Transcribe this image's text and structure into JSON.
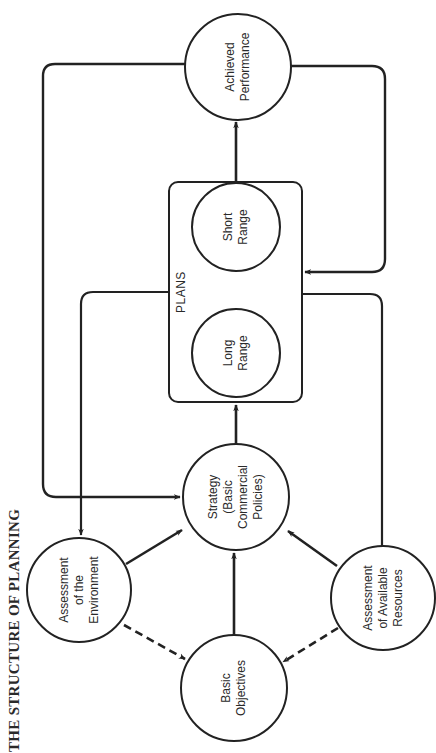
{
  "title": "THE STRUCTURE OF PLANNING",
  "colors": {
    "ink": "#222222",
    "background": "#ffffff"
  },
  "plans_group": {
    "label": "PLANS"
  },
  "nodes": {
    "achieved_performance": {
      "lines": [
        "Achieved",
        "Performance"
      ]
    },
    "short_range": {
      "lines": [
        "Short",
        "Range"
      ]
    },
    "long_range": {
      "lines": [
        "Long",
        "Range"
      ]
    },
    "strategy": {
      "lines": [
        "Strategy",
        "(Basic",
        "Commercial",
        "Policies)"
      ]
    },
    "assessment_environment": {
      "lines": [
        "Assessment",
        "of the",
        "Environment"
      ]
    },
    "basic_objectives": {
      "lines": [
        "Basic",
        "Objectives"
      ]
    },
    "assessment_resources": {
      "lines": [
        "Assessment",
        "of Available",
        "Resources"
      ]
    }
  },
  "edges": [
    {
      "from": "Strategy (Basic Commercial Policies)",
      "to": "PLANS",
      "style": "solid"
    },
    {
      "from": "Long Range",
      "to": "Short Range",
      "style": "solid"
    },
    {
      "from": "Short Range",
      "to": "Achieved Performance",
      "style": "solid"
    },
    {
      "from": "Achieved Performance",
      "to": "Strategy (Basic Commercial Policies)",
      "style": "solid",
      "route": "feedback-loop-left"
    },
    {
      "from": "Achieved Performance",
      "to": "PLANS",
      "style": "solid",
      "route": "feedback-loop-right"
    },
    {
      "from": "PLANS",
      "to": "Assessment of the Environment",
      "style": "solid"
    },
    {
      "from": "PLANS",
      "to": "Assessment of Available Resources",
      "style": "solid",
      "arrow": false
    },
    {
      "from": "Assessment of the Environment",
      "to": "Strategy (Basic Commercial Policies)",
      "style": "solid"
    },
    {
      "from": "Assessment of Available Resources",
      "to": "Strategy (Basic Commercial Policies)",
      "style": "solid"
    },
    {
      "from": "Basic Objectives",
      "to": "Strategy (Basic Commercial Policies)",
      "style": "solid"
    },
    {
      "from": "Assessment of the Environment",
      "to": "Basic Objectives",
      "style": "dashed"
    },
    {
      "from": "Assessment of Available Resources",
      "to": "Basic Objectives",
      "style": "dashed"
    }
  ]
}
